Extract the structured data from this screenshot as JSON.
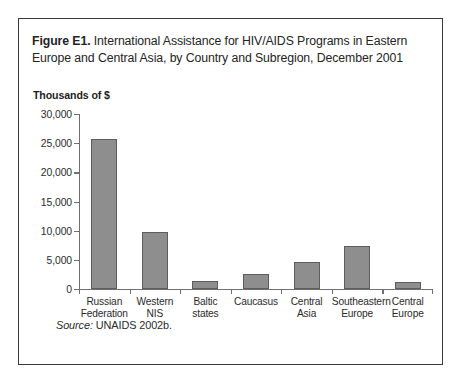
{
  "figure": {
    "label": "Figure E1.",
    "caption": " International Assistance for HIV/AIDS Programs in Eastern Europe and Central Asia, by Country and Subregion, December 2001",
    "source_label": "Source:",
    "source_text": " UNAIDS 2002b.",
    "frame_color": "#3a3a3a"
  },
  "chart_data": {
    "type": "bar",
    "title": "Figure E1. International Assistance for HIV/AIDS Programs in Eastern Europe and Central Asia, by Country and Subregion, December 2001",
    "ylabel": "Thousands of $",
    "xlabel": "",
    "ylim": [
      0,
      30000
    ],
    "ytick_step": 5000,
    "ytick_labels": [
      "30,000",
      "25,000",
      "20,000",
      "15,000",
      "10,000",
      "5,000",
      "0"
    ],
    "ytick_values": [
      30000,
      25000,
      20000,
      15000,
      10000,
      5000,
      0
    ],
    "grid": false,
    "legend": "none",
    "bar_color": "#8e8e8e",
    "bar_edge_color": "#5d5d5d",
    "categories": [
      "Russian\nFederation",
      "Western\nNIS",
      "Baltic\nstates",
      "Caucasus",
      "Central\nAsia",
      "Southeastern\nEurope",
      "Central\nEurope"
    ],
    "category_lines": [
      [
        "Russian",
        "Federation"
      ],
      [
        "Western",
        "NIS"
      ],
      [
        "Baltic",
        "states"
      ],
      [
        "Caucasus",
        ""
      ],
      [
        "Central",
        "Asia"
      ],
      [
        "Southeastern",
        "Europe"
      ],
      [
        "Central",
        "Europe"
      ]
    ],
    "values": [
      25700,
      9800,
      1300,
      2600,
      4700,
      7300,
      1200
    ]
  }
}
